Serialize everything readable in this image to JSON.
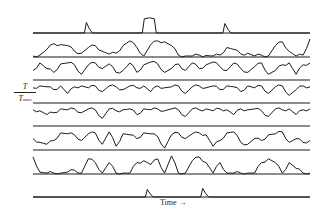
{
  "chart_data": {
    "type": "line",
    "title": "",
    "xlabel": "Time →",
    "ylabel": "T / T_max",
    "ylabel_parts": {
      "numerator": "T",
      "denominator": "T",
      "subscript": "max"
    },
    "layout": "stacked traces, each with its own baseline; no tick marks; no grid; no legend",
    "x_range": [
      0,
      100
    ],
    "series": [
      {
        "name": "trace 1",
        "baseline_y": 33,
        "peaks": [
          {
            "x": 20,
            "h": 0.55
          },
          {
            "x": 42,
            "h": 0.75,
            "width": 5
          },
          {
            "x": 70,
            "h": 0.5
          }
        ]
      },
      {
        "name": "trace 2",
        "baseline_y": 57,
        "description": "intermittent bursts",
        "values": [
          0.05,
          0.1,
          0.4,
          0.7,
          0.65,
          0.6,
          0.3,
          0.2,
          0.5,
          0.6,
          0.3,
          0.15,
          0.2,
          0.6,
          0.85,
          0.5,
          0.05,
          0.65,
          0.85,
          0.8,
          0.6,
          0.1,
          0.05,
          0.05,
          0.1,
          0.08,
          0.05,
          0.1,
          0.5,
          0.4,
          0.15,
          0.2,
          0.05,
          0.1,
          0.05,
          0.6,
          0.8,
          0.3,
          0.05,
          0.1,
          0.95
        ]
      },
      {
        "name": "trace 3",
        "baseline_y": 80,
        "description": "strongly fluctuating",
        "values": [
          0.5,
          0.9,
          0.6,
          0.4,
          0.85,
          0.9,
          0.8,
          0.3,
          0.8,
          0.9,
          0.6,
          0.85,
          0.4,
          0.5,
          0.9,
          0.4,
          0.8,
          0.95,
          0.85,
          0.4,
          0.6,
          0.85,
          0.5,
          0.9,
          0.6,
          0.8,
          0.95,
          0.7,
          0.5,
          0.9,
          0.6,
          0.4,
          0.7,
          0.9,
          0.3,
          0.5,
          0.8,
          0.9,
          0.3,
          0.8,
          0.9
        ]
      },
      {
        "name": "trace 4",
        "baseline_y": 103,
        "description": "near-saturated with dips",
        "values": [
          0.8,
          0.9,
          0.85,
          0.7,
          0.9,
          0.5,
          0.85,
          0.9,
          0.8,
          0.9,
          0.6,
          0.9,
          0.85,
          0.7,
          0.9,
          0.8,
          0.9,
          0.6,
          0.9,
          0.8,
          0.85,
          0.9,
          0.5,
          0.85,
          0.9,
          0.8,
          0.9,
          0.7,
          0.9,
          0.85,
          0.6,
          0.9,
          0.8,
          0.9,
          0.5,
          0.85,
          0.9,
          0.4,
          0.7,
          0.9,
          0.85
        ]
      },
      {
        "name": "trace 5",
        "baseline_y": 126,
        "description": "near-saturated with dips",
        "values": [
          0.85,
          0.8,
          0.6,
          0.7,
          0.9,
          0.85,
          0.9,
          0.7,
          0.9,
          0.85,
          0.4,
          0.9,
          0.8,
          0.85,
          0.9,
          0.6,
          0.9,
          0.85,
          0.9,
          0.8,
          0.9,
          0.85,
          0.5,
          0.9,
          0.85,
          0.9,
          0.8,
          0.9,
          0.85,
          0.6,
          0.9,
          0.85,
          0.9,
          0.8,
          0.5,
          0.9,
          0.85,
          0.9,
          0.6,
          0.85,
          0.9
        ]
      },
      {
        "name": "trace 6",
        "baseline_y": 150,
        "description": "strongly fluctuating",
        "values": [
          0.6,
          0.4,
          0.3,
          0.5,
          0.9,
          0.85,
          0.8,
          0.5,
          0.85,
          0.9,
          0.3,
          0.95,
          0.2,
          0.85,
          0.8,
          0.6,
          0.9,
          0.85,
          0.7,
          0.1,
          0.8,
          0.9,
          0.6,
          0.85,
          0.9,
          0.8,
          0.2,
          0.5,
          0.9,
          0.95,
          0.4,
          0.3,
          0.6,
          0.5,
          0.8,
          0.85,
          0.95,
          0.4,
          0.6,
          0.4,
          0.5
        ]
      },
      {
        "name": "trace 7",
        "baseline_y": 174,
        "description": "intermittent bursts",
        "values": [
          0.9,
          0.1,
          0.05,
          0.05,
          0.05,
          0.1,
          0.2,
          0.05,
          0.8,
          0.6,
          0.05,
          0.6,
          0.05,
          0.05,
          0.05,
          0.6,
          0.7,
          0.5,
          0.8,
          0.05,
          0.95,
          0.05,
          0.05,
          0.7,
          0.9,
          0.6,
          0.05,
          0.6,
          0.05,
          0.05,
          0.05,
          0.05,
          0.05,
          0.6,
          0.8,
          0.6,
          0.05,
          0.6,
          0.3,
          0.05,
          0.05
        ]
      },
      {
        "name": "trace 8",
        "baseline_y": 197,
        "peaks": [
          {
            "x": 42,
            "h": 0.4
          },
          {
            "x": 62,
            "h": 0.45
          }
        ]
      }
    ]
  },
  "labels": {
    "y_num": "T",
    "y_den": "T",
    "y_sub": "max",
    "x": "Time →"
  }
}
